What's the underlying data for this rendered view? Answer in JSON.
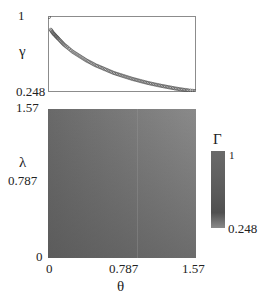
{
  "top_panel": {
    "ylabel": "γ",
    "yticks": [
      "1",
      "0.248"
    ]
  },
  "bottom_panel": {
    "ylabel": "λ",
    "xlabel": "θ",
    "yticks": [
      "1.57",
      "0.787",
      "0"
    ],
    "xticks": [
      "0",
      "0.787",
      "1.57"
    ]
  },
  "colorbar": {
    "label": "Γ",
    "max_label": "1",
    "min_label": "0.248",
    "color_max": "#6a6a6a",
    "color_min": "#8a8a8a"
  },
  "colors": {
    "axis": "#8c8c8c",
    "marker": "#555555",
    "heat_dark": "#4e4e4e",
    "heat_light": "#8e8e8e"
  },
  "chart_data": [
    {
      "type": "scatter",
      "title": "",
      "xlabel": "θ",
      "ylabel": "γ",
      "xlim": [
        0,
        1.57
      ],
      "ylim": [
        0.248,
        1
      ],
      "x": [
        0.0,
        0.02,
        0.04,
        0.06,
        0.08,
        0.1,
        0.13,
        0.16,
        0.2,
        0.25,
        0.3,
        0.35,
        0.4,
        0.45,
        0.5,
        0.55,
        0.6,
        0.65,
        0.7,
        0.75,
        0.8,
        0.85,
        0.9,
        0.95,
        1.0,
        1.05,
        1.1,
        1.15,
        1.2,
        1.25,
        1.3,
        1.35,
        1.4,
        1.45,
        1.5,
        1.57
      ],
      "y": [
        1.0,
        0.87,
        0.84,
        0.82,
        0.8,
        0.78,
        0.75,
        0.72,
        0.69,
        0.65,
        0.62,
        0.59,
        0.56,
        0.535,
        0.51,
        0.49,
        0.47,
        0.45,
        0.43,
        0.415,
        0.4,
        0.385,
        0.37,
        0.358,
        0.345,
        0.333,
        0.322,
        0.312,
        0.302,
        0.293,
        0.284,
        0.275,
        0.267,
        0.26,
        0.254,
        0.248
      ]
    },
    {
      "type": "heatmap",
      "title": "",
      "xlabel": "θ",
      "ylabel": "λ",
      "xlim": [
        0,
        1.57
      ],
      "ylim": [
        0,
        1.57
      ],
      "xticks": [
        0,
        0.787,
        1.57
      ],
      "yticks": [
        0,
        0.787,
        1.57
      ],
      "colorbar": {
        "label": "Γ",
        "range": [
          0.248,
          1
        ]
      },
      "description": "Γ(θ, λ): darkest (lowest) near θ=0, λ=0; lighter toward larger θ and larger λ"
    }
  ]
}
